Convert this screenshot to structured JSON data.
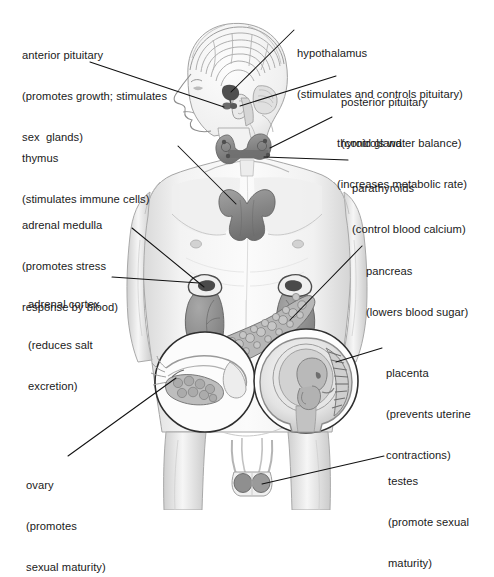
{
  "diagram": {
    "style": "grayscale pencil medical illustration",
    "colors": {
      "background": "#ffffff",
      "ink": "#1a1a1a",
      "leader_line": "#111111",
      "body_shade_light": "#ededed",
      "body_shade_mid": "#d6d6d6",
      "body_outline": "#9a9a9a",
      "gland_dark": "#7d7d7d",
      "gland_mid": "#9b9b9b",
      "organ_gray": "#8f8f8f",
      "inset_circle_outline": "#2b2b2b"
    },
    "labels": [
      {
        "id": "anterior-pituitary",
        "lines": [
          "anterior pituitary",
          "(promotes growth; stimulates",
          "sex  glands)"
        ],
        "x": 22,
        "y": 22,
        "align": "left",
        "leader": "from label to pituitary within brain"
      },
      {
        "id": "hypothalamus",
        "lines": [
          "hypothalamus",
          "(stimulates and controls pituitary)"
        ],
        "x": 297,
        "y": 20,
        "align": "left",
        "leader": "from label down-left to hypothalamus in brain"
      },
      {
        "id": "posterior-pituitary",
        "lines": [
          "posterior pituitary",
          "(controls water balance)"
        ],
        "x": 341,
        "y": 69,
        "align": "left",
        "leader": "horizontal from label left to pituitary stalk"
      },
      {
        "id": "thyroid-gland",
        "lines": [
          "thyroid gland",
          "(increases metabolic rate)"
        ],
        "x": 337,
        "y": 110,
        "align": "left",
        "leader": "diagonal down-left to thyroid at neck base"
      },
      {
        "id": "parathyroids",
        "lines": [
          "parathyroids",
          "(control blood calcium)"
        ],
        "x": 352,
        "y": 155,
        "align": "left",
        "leader": "horizontal left to parathyroid lobes"
      },
      {
        "id": "thymus",
        "lines": [
          "thymus",
          "(stimulates immune cells)"
        ],
        "x": 22,
        "y": 125,
        "align": "left",
        "leader": "diagonal down-right to thymus in chest"
      },
      {
        "id": "adrenal-medulla",
        "lines": [
          "adrenal medulla",
          "(promotes stress",
          "response by blood)"
        ],
        "x": 22,
        "y": 192,
        "align": "left",
        "leader": "diagonal down-right to adrenal gland atop right kidney"
      },
      {
        "id": "adrenal-cortex",
        "lines": [
          "adrenal cortex",
          "(reduces salt",
          "excretion)"
        ],
        "x": 28,
        "y": 271,
        "align": "left",
        "leader": "horizontal right to adrenal cortex"
      },
      {
        "id": "pancreas",
        "lines": [
          "pancreas",
          "(lowers blood sugar)"
        ],
        "x": 366,
        "y": 238,
        "align": "left",
        "leader": "diagonal down-left to pancreas"
      },
      {
        "id": "placenta",
        "lines": [
          "placenta",
          "(prevents uterine",
          "contractions)"
        ],
        "x": 386,
        "y": 340,
        "align": "left",
        "leader": "horizontal left into uterus inset circle"
      },
      {
        "id": "ovary",
        "lines": [
          "ovary",
          "(promotes",
          "sexual maturity)"
        ],
        "x": 26,
        "y": 452,
        "align": "left",
        "leader": "diagonal up-right into ovary inset circle"
      },
      {
        "id": "testes",
        "lines": [
          "testes",
          "(promote sexual",
          "maturity)"
        ],
        "x": 388,
        "y": 448,
        "align": "left",
        "leader": "diagonal up-left to testes"
      }
    ],
    "anatomy_parts": [
      {
        "id": "brain",
        "name": "brain cross-section in left-profile head"
      },
      {
        "id": "pituitary",
        "name": "pituitary gland"
      },
      {
        "id": "hypothalamus",
        "name": "hypothalamus"
      },
      {
        "id": "thyroid",
        "name": "thyroid gland at neck"
      },
      {
        "id": "parathyroids",
        "name": "parathyroid glands"
      },
      {
        "id": "thymus",
        "name": "butterfly-shaped thymus in upper chest"
      },
      {
        "id": "kidney-left",
        "name": "left kidney"
      },
      {
        "id": "kidney-right",
        "name": "right kidney"
      },
      {
        "id": "adrenal-left",
        "name": "left adrenal gland"
      },
      {
        "id": "adrenal-right",
        "name": "right adrenal gland"
      },
      {
        "id": "pancreas",
        "name": "pancreas"
      },
      {
        "id": "ovary-inset",
        "name": "ovary and fallopian tube inset circle"
      },
      {
        "id": "uterus-inset",
        "name": "fetus in uterus with placenta inset circle"
      },
      {
        "id": "testes",
        "name": "testes and scrotum"
      }
    ]
  }
}
